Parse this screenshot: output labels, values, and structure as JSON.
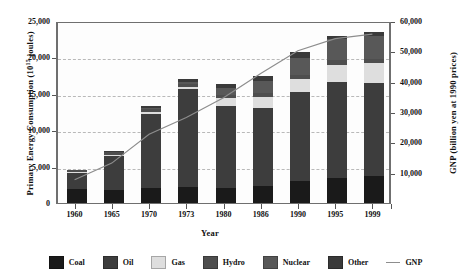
{
  "chart_data": {
    "type": "bar",
    "title": "",
    "xlabel": "Year",
    "ylabel": "Primary Energy Consumption (10¹⁵ joules)",
    "ylabel_left_prefix": "Primary Energy Consumption (10",
    "ylabel_left_exp": "15",
    "ylabel_left_suffix": " joules)",
    "ylabel_right": "GNP (billion yen at 1990 prices)",
    "grid": true,
    "legend_position": "bottom",
    "categories": [
      "1960",
      "1965",
      "1970",
      "1973",
      "1980",
      "1986",
      "1990",
      "1995",
      "1999"
    ],
    "ylim": [
      0,
      25000
    ],
    "yticks": [
      "0",
      "5,000",
      "10,000",
      "15,000",
      "20,000",
      "25,000"
    ],
    "ytick_values": [
      0,
      5000,
      10000,
      15000,
      20000,
      25000
    ],
    "y2lim": [
      0,
      60000
    ],
    "y2ticks": [
      "10,000",
      "20,000",
      "30,000",
      "40,000",
      "50,000",
      "60,000"
    ],
    "y2tick_values": [
      10000,
      20000,
      30000,
      40000,
      50000,
      60000
    ],
    "stacked": true,
    "series": [
      {
        "name": "Coal",
        "color": "#1a1a1a",
        "values": [
          1900,
          1850,
          2100,
          2150,
          2100,
          2400,
          3000,
          3400,
          3700
        ]
      },
      {
        "name": "Oil",
        "color": "#3d3d3d",
        "values": [
          2200,
          4600,
          10100,
          13500,
          11200,
          10700,
          12200,
          13200,
          12800
        ]
      },
      {
        "name": "Gas",
        "color": "#dedede",
        "values": [
          100,
          150,
          300,
          350,
          1100,
          1500,
          1900,
          2400,
          2700
        ]
      },
      {
        "name": "Hydro",
        "color": "#4e4e4e",
        "values": [
          300,
          350,
          400,
          400,
          450,
          500,
          550,
          600,
          600
        ]
      },
      {
        "name": "Nuclear",
        "color": "#585858",
        "values": [
          0,
          0,
          100,
          200,
          900,
          1700,
          2300,
          2900,
          3100
        ]
      },
      {
        "name": "Other",
        "color": "#3a3a3a",
        "values": [
          100,
          150,
          400,
          500,
          600,
          600,
          800,
          500,
          600
        ]
      }
    ],
    "line_series": {
      "name": "GNP",
      "color": "#8d8d8d",
      "axis": "right",
      "values": [
        8000,
        13500,
        23000,
        28500,
        35000,
        43000,
        50500,
        54500,
        56000
      ]
    }
  },
  "legend": {
    "items": [
      {
        "label": "Coal",
        "swatch": "#1a1a1a",
        "type": "box"
      },
      {
        "label": "Oil",
        "swatch": "#3d3d3d",
        "type": "box"
      },
      {
        "label": "Gas",
        "swatch": "#dedede",
        "type": "box"
      },
      {
        "label": "Hydro",
        "swatch": "#4e4e4e",
        "type": "box"
      },
      {
        "label": "Nuclear",
        "swatch": "#585858",
        "type": "box"
      },
      {
        "label": "Other",
        "swatch": "#3a3a3a",
        "type": "box"
      },
      {
        "label": "GNP",
        "swatch": "#8d8d8d",
        "type": "line"
      }
    ]
  }
}
